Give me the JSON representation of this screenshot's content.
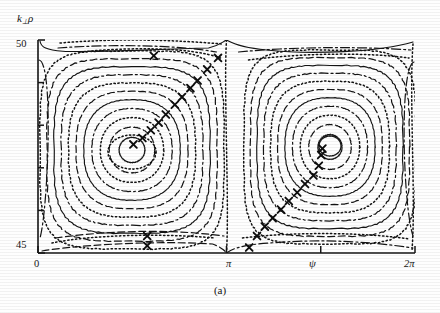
{
  "figure": {
    "caption": "(a)",
    "type": "contour",
    "ylabel": "k",
    "ylabel_sub": "⊥",
    "ylabel_tail": "ρ",
    "xlabel": "ψ"
  },
  "axes": {
    "y_ticks": [
      "50",
      "45"
    ],
    "y_minor_count": 4,
    "x_ticks": [
      "0",
      "π",
      "2π"
    ],
    "ylim": [
      45,
      50
    ],
    "xlim": [
      0,
      6.283185
    ],
    "x_tick_values": [
      0,
      3.14159,
      6.283185
    ]
  },
  "chart_data": {
    "type": "contour",
    "title": "",
    "xlabel": "ψ",
    "ylabel": "k⊥ρ",
    "xlim": [
      0,
      6.283185
    ],
    "ylim": [
      45,
      50
    ],
    "x_tick_labels": [
      "0",
      "π",
      "2π"
    ],
    "y_tick_labels": [
      "45",
      "50"
    ],
    "grid": false,
    "legend": null,
    "islands": [
      {
        "name": "left-island",
        "o_point": {
          "psi": 3.07,
          "k": 47.47
        },
        "x_points": [
          {
            "psi": 0.0,
            "k": 49.6
          },
          {
            "psi": 3.14159,
            "k": 49.6
          }
        ],
        "n_contours": 11
      },
      {
        "name": "right-island",
        "o_point": {
          "psi": 4.72,
          "k": 47.54
        },
        "x_points": [
          {
            "psi": 3.14159,
            "k": 44.9
          },
          {
            "psi": 6.283185,
            "k": 44.9
          }
        ],
        "n_contours": 11
      }
    ],
    "contour_line_styles": [
      "solid",
      "dashed",
      "dotted",
      "dash-dot"
    ],
    "marker": {
      "glyph": "x",
      "label": "orbit-sample",
      "count": 26
    },
    "marker_points": [
      {
        "psi": 1.93,
        "k": 49.63
      },
      {
        "psi": 3.0,
        "k": 49.58
      },
      {
        "psi": 2.82,
        "k": 49.31
      },
      {
        "psi": 2.66,
        "k": 49.05
      },
      {
        "psi": 2.54,
        "k": 48.87
      },
      {
        "psi": 2.4,
        "k": 48.66
      },
      {
        "psi": 2.28,
        "k": 48.48
      },
      {
        "psi": 2.13,
        "k": 48.25
      },
      {
        "psi": 2.01,
        "k": 48.06
      },
      {
        "psi": 1.88,
        "k": 47.88
      },
      {
        "psi": 1.74,
        "k": 47.7
      },
      {
        "psi": 1.59,
        "k": 47.55
      },
      {
        "psi": 1.82,
        "k": 45.4
      },
      {
        "psi": 1.82,
        "k": 45.17
      },
      {
        "psi": 3.52,
        "k": 45.13
      },
      {
        "psi": 3.65,
        "k": 45.4
      },
      {
        "psi": 3.78,
        "k": 45.62
      },
      {
        "psi": 3.91,
        "k": 45.82
      },
      {
        "psi": 4.05,
        "k": 46.02
      },
      {
        "psi": 4.18,
        "k": 46.22
      },
      {
        "psi": 4.32,
        "k": 46.42
      },
      {
        "psi": 4.45,
        "k": 46.62
      },
      {
        "psi": 4.59,
        "k": 46.82
      },
      {
        "psi": 4.68,
        "k": 47.05
      },
      {
        "psi": 4.72,
        "k": 47.3
      },
      {
        "psi": 4.74,
        "k": 47.45
      }
    ]
  }
}
